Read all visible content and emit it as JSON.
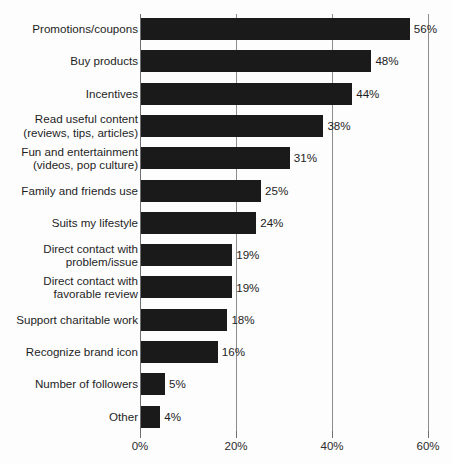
{
  "chart_data": {
    "type": "bar",
    "orientation": "horizontal",
    "title": "",
    "subtitle": "",
    "xlabel": "",
    "ylabel": "",
    "xlim": [
      0,
      60
    ],
    "grid": true,
    "legend": null,
    "value_suffix": "%",
    "xticks": [
      "0%",
      "20%",
      "40%",
      "60%"
    ],
    "xtick_values": [
      0,
      20,
      40,
      60
    ],
    "categories": [
      "Promotions/coupons",
      "Buy products",
      "Incentives",
      "Read useful content\n(reviews, tips, articles)",
      "Fun and entertainment\n(videos, pop culture)",
      "Family and friends use",
      "Suits my lifestyle",
      "Direct contact with\nproblem/issue",
      "Direct contact with\nfavorable review",
      "Support charitable work",
      "Recognize brand icon",
      "Number of followers",
      "Other"
    ],
    "values": [
      56,
      48,
      44,
      38,
      31,
      25,
      24,
      19,
      19,
      18,
      16,
      5,
      4
    ],
    "data_labels": [
      "56%",
      "48%",
      "44%",
      "38%",
      "31%",
      "25%",
      "24%",
      "19%",
      "19%",
      "18%",
      "16%",
      "5%",
      "4%"
    ],
    "colors": {
      "bar": "#1a1a1a",
      "gridline": "#8d8d8d",
      "axis": "#6e6e6e",
      "text": "#1d1d1d",
      "background": "#fdfdfd"
    }
  }
}
